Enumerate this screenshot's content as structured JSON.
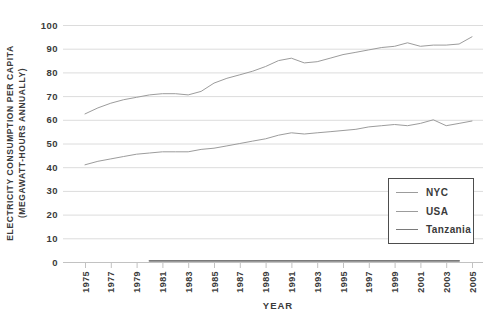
{
  "page": {
    "background": "#ffffff"
  },
  "colors": {
    "grid": "#dcdcdc",
    "axis": "#c2c2c2",
    "tick_text": "#3b3b3b",
    "legend_border": "#4d4d4d"
  },
  "chart_data": {
    "type": "line",
    "title": "",
    "xlabel": "YEAR",
    "ylabel_line1": "ELECTRICITY CONSUMPTION PER CAPITA",
    "ylabel_line2": "(MEGAWATT-HOURS ANNUALLY)",
    "xlim": [
      1975,
      2005
    ],
    "ylim": [
      0,
      100
    ],
    "x_ticks": [
      1975,
      1977,
      1979,
      1981,
      1983,
      1985,
      1987,
      1989,
      1991,
      1993,
      1995,
      1997,
      1999,
      2001,
      2003,
      2005
    ],
    "y_ticks": [
      0,
      10,
      20,
      30,
      40,
      50,
      60,
      70,
      80,
      90,
      100
    ],
    "grid": "horizontal-only",
    "legend_position": "lower-right-box",
    "series": [
      {
        "name": "NYC",
        "color": "#9c9c9c",
        "stroke_width": 1,
        "x_start": 1975,
        "x_step": 1,
        "values": [
          62.5,
          65,
          67,
          68.5,
          69.5,
          70.5,
          71,
          71,
          70.5,
          72,
          75.5,
          77.5,
          79,
          80.5,
          82.5,
          85,
          86,
          84,
          84.5,
          86,
          87.5,
          88.5,
          89.5,
          90.5,
          91,
          92.5,
          91,
          91.5,
          91.5,
          92,
          95
        ]
      },
      {
        "name": "USA",
        "color": "#9c9c9c",
        "stroke_width": 1,
        "x_start": 1975,
        "x_step": 1,
        "values": [
          41,
          42.5,
          43.5,
          44.5,
          45.5,
          46,
          46.5,
          46.5,
          46.5,
          47.5,
          48,
          49,
          50,
          51,
          52,
          53.5,
          54.5,
          54,
          54.5,
          55,
          55.5,
          56,
          57,
          57.5,
          58,
          57.5,
          58.5,
          60,
          57.5,
          58.5,
          59.5
        ]
      },
      {
        "name": "Tanzania",
        "color": "#7a7a7a",
        "stroke_width": 1.8,
        "x_start": 1980,
        "x_step": 1,
        "values": [
          0.5,
          0.5,
          0.5,
          0.5,
          0.5,
          0.5,
          0.5,
          0.5,
          0.5,
          0.5,
          0.5,
          0.5,
          0.5,
          0.5,
          0.5,
          0.5,
          0.5,
          0.5,
          0.5,
          0.5,
          0.5,
          0.5,
          0.5,
          0.5,
          0.5
        ]
      }
    ]
  }
}
